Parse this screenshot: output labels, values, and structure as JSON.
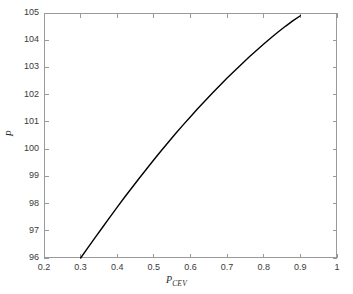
{
  "chart_data": {
    "type": "line",
    "title": "",
    "subtitle": "",
    "xlabel": "P_CEV",
    "xlabel_base": "P",
    "xlabel_sub": "CEV",
    "ylabel": "P",
    "xlim": [
      0.2,
      1.0
    ],
    "ylim": [
      96,
      105
    ],
    "xticks": [
      "0.2",
      "0.3",
      "0.4",
      "0.5",
      "0.6",
      "0.7",
      "0.8",
      "0.9",
      "1"
    ],
    "xtick_values": [
      0.2,
      0.3,
      0.4,
      0.5,
      0.6,
      0.7,
      0.8,
      0.9,
      1.0
    ],
    "yticks": [
      "96",
      "97",
      "98",
      "99",
      "100",
      "101",
      "102",
      "103",
      "104",
      "105"
    ],
    "ytick_values": [
      96,
      97,
      98,
      99,
      100,
      101,
      102,
      103,
      104,
      105
    ],
    "grid": false,
    "legend": null,
    "legend_position": "none",
    "line_color": "#000000",
    "line_width": 1.4,
    "axis_color": "#9a9a9a",
    "background_color": "#ffffff",
    "series": [
      {
        "name": "P vs P_CEV",
        "x": [
          0.3,
          0.32,
          0.34,
          0.36,
          0.38,
          0.4,
          0.42,
          0.44,
          0.46,
          0.48,
          0.5,
          0.52,
          0.54,
          0.56,
          0.58,
          0.6,
          0.62,
          0.64,
          0.66,
          0.68,
          0.7,
          0.72,
          0.74,
          0.76,
          0.78,
          0.8,
          0.82,
          0.84,
          0.86,
          0.88,
          0.9
        ],
        "y": [
          96.0,
          96.38,
          96.76,
          97.13,
          97.5,
          97.87,
          98.23,
          98.58,
          98.93,
          99.27,
          99.61,
          99.94,
          100.26,
          100.58,
          100.89,
          101.19,
          101.49,
          101.78,
          102.06,
          102.34,
          102.61,
          102.87,
          103.13,
          103.38,
          103.62,
          103.86,
          104.09,
          104.31,
          104.52,
          104.72,
          104.9
        ]
      }
    ]
  }
}
